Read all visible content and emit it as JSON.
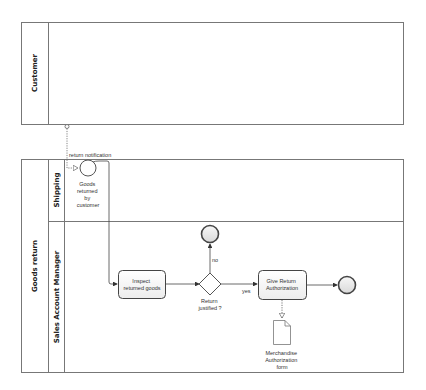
{
  "diagram": {
    "type": "BPMN collaboration",
    "pools": [
      {
        "id": "customer",
        "label": "Customer"
      },
      {
        "id": "goods_return",
        "label": "Goods return",
        "lanes": [
          {
            "id": "shipping",
            "label": "Shipping"
          },
          {
            "id": "sam",
            "label": "Sales Account Manager"
          }
        ]
      }
    ],
    "message_flow": {
      "label": "return notification"
    },
    "events": {
      "start": {
        "label_lines": [
          "Goods",
          "returned",
          "by",
          "customer"
        ]
      },
      "end_rejected": {
        "label": ""
      },
      "end_authorized": {
        "label": ""
      }
    },
    "tasks": {
      "inspect": {
        "label_lines": [
          "Inspect",
          "returned goods"
        ]
      },
      "authorize": {
        "label_lines": [
          "Give Return",
          "Authorization"
        ]
      }
    },
    "gateway": {
      "label_lines": [
        "Return",
        "justified ?"
      ],
      "no_label": "no",
      "yes_label": "yes"
    },
    "data_object": {
      "label_lines": [
        "Merchandise",
        "Authorization",
        "form"
      ]
    },
    "colors": {
      "stroke": "#6e6e6e",
      "task_fill": "#f4f4f4",
      "event_fill": "#e8e8e8",
      "line": "#555555"
    }
  }
}
